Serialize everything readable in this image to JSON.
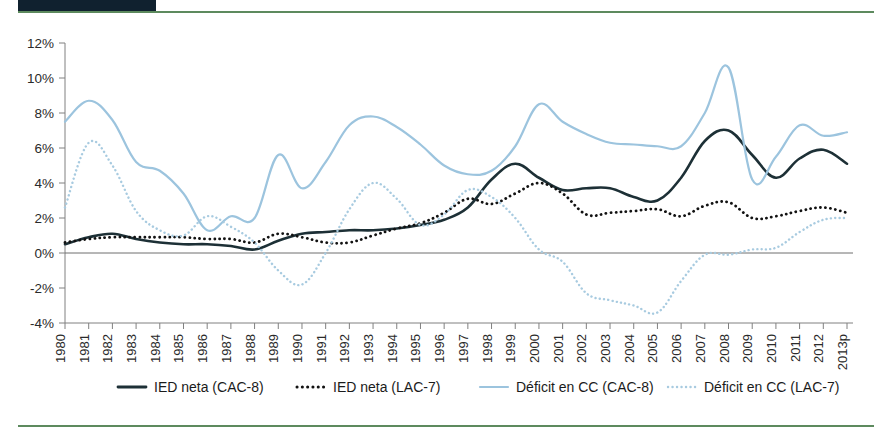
{
  "page": {
    "title_partial": "",
    "accent_green": "#5d8a5e",
    "tag_color": "#10212f"
  },
  "chart_data": {
    "type": "line",
    "title": "",
    "xlabel": "",
    "ylabel": "",
    "ylim": [
      -4,
      12
    ],
    "yticks": [
      "-4%",
      "-2%",
      "0%",
      "2%",
      "4%",
      "6%",
      "8%",
      "10%",
      "12%"
    ],
    "ytick_values": [
      -4,
      -2,
      0,
      2,
      4,
      6,
      8,
      10,
      12
    ],
    "grid": false,
    "zero_line": true,
    "legend_position": "bottom",
    "categories": [
      "1980",
      "1981",
      "1982",
      "1983",
      "1984",
      "1985",
      "1986",
      "1987",
      "1988",
      "1989",
      "1990",
      "1991",
      "1992",
      "1993",
      "1994",
      "1995",
      "1996",
      "1997",
      "1998",
      "1999",
      "2000",
      "2001",
      "2002",
      "2003",
      "2004",
      "2005",
      "2006",
      "2007",
      "2008",
      "2009",
      "2010",
      "2011",
      "2012",
      "2013p"
    ],
    "series": [
      {
        "name": "IED neta (CAC-8)",
        "style": "solid",
        "color": "#1d3036",
        "width": 2.6,
        "values": [
          0.5,
          0.9,
          1.1,
          0.8,
          0.6,
          0.5,
          0.5,
          0.4,
          0.2,
          0.7,
          1.1,
          1.2,
          1.3,
          1.3,
          1.4,
          1.6,
          1.9,
          2.6,
          4.2,
          5.1,
          4.3,
          3.6,
          3.7,
          3.7,
          3.2,
          3.0,
          4.3,
          6.4,
          7.0,
          5.6,
          4.3,
          5.4,
          5.9,
          5.1
        ]
      },
      {
        "name": "IED neta (LAC-7)",
        "style": "dotted",
        "color": "#121212",
        "width": 2.8,
        "values": [
          0.6,
          0.8,
          0.9,
          0.9,
          0.9,
          0.9,
          0.8,
          0.8,
          0.6,
          1.1,
          0.9,
          0.6,
          0.6,
          1.0,
          1.4,
          1.7,
          2.3,
          3.1,
          2.8,
          3.4,
          4.0,
          3.4,
          2.2,
          2.3,
          2.4,
          2.5,
          2.1,
          2.7,
          2.9,
          2.0,
          2.1,
          2.4,
          2.6,
          2.3
        ]
      },
      {
        "name": "Déficit en CC (CAC-8)",
        "style": "solid",
        "color": "#9cc4de",
        "width": 2.2,
        "values": [
          7.5,
          8.7,
          7.6,
          5.2,
          4.7,
          3.4,
          1.3,
          2.1,
          2.0,
          5.6,
          3.7,
          5.2,
          7.3,
          7.8,
          7.2,
          6.2,
          5.0,
          4.5,
          4.7,
          6.1,
          8.5,
          7.5,
          6.8,
          6.3,
          6.2,
          6.1,
          6.1,
          8.0,
          10.6,
          4.2,
          5.5,
          7.3,
          6.7,
          6.9
        ]
      },
      {
        "name": "Déficit en CC (LAC-7)",
        "style": "dotted",
        "color": "#a8cbe0",
        "width": 2.4,
        "values": [
          2.6,
          6.3,
          5.0,
          2.4,
          1.3,
          1.0,
          2.1,
          1.5,
          0.6,
          -1.0,
          -1.8,
          0.0,
          2.5,
          4.0,
          3.1,
          1.6,
          2.2,
          3.6,
          3.2,
          2.0,
          0.2,
          -0.5,
          -2.3,
          -2.7,
          -3.0,
          -3.4,
          -1.6,
          -0.1,
          -0.1,
          0.2,
          0.3,
          1.2,
          1.9,
          2.0
        ]
      }
    ],
    "legend": [
      {
        "label": "IED neta (CAC-8)",
        "style": "solid",
        "color": "#1d3036"
      },
      {
        "label": "IED neta (LAC-7)",
        "style": "dotted",
        "color": "#121212"
      },
      {
        "label": "Déficit en CC (CAC-8)",
        "style": "solid",
        "color": "#9cc4de"
      },
      {
        "label": "Déficit en CC (LAC-7)",
        "style": "dotted",
        "color": "#a8cbe0"
      }
    ]
  }
}
